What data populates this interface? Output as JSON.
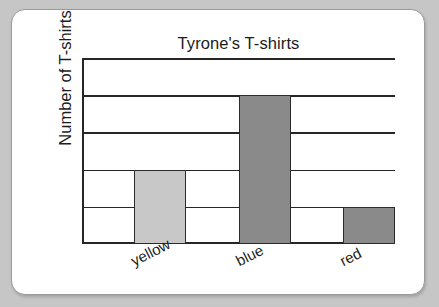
{
  "card": {
    "background_color": "#ffffff",
    "border_color": "#9b9b9b",
    "page_background_color": "#c6c6c6"
  },
  "chart_data": {
    "type": "bar",
    "title": "Tyrone's T-shirts",
    "xlabel": "",
    "ylabel": "Number of T-shirts",
    "categories": [
      "yellow",
      "blue",
      "red"
    ],
    "values": [
      2,
      4,
      1
    ],
    "ylim": [
      0,
      5
    ],
    "yticks": [
      0,
      1,
      2,
      3,
      4,
      5
    ],
    "ytick_labels": [
      "",
      "",
      "",
      "",
      "",
      ""
    ],
    "grid": true,
    "grid_orientation": "horizontal",
    "legend": "none",
    "bar_colors": [
      "#c8c8c8",
      "#8a8a8a",
      "#8a8a8a"
    ],
    "bar_edge_color": "#2b2b2b",
    "axis_color": "#262626",
    "x_tick_rotation": -27,
    "bars": [
      {
        "category": "yellow",
        "value": 2,
        "fill": "#c8c8c8"
      },
      {
        "category": "blue",
        "value": 4,
        "fill": "#8a8a8a"
      },
      {
        "category": "red",
        "value": 1,
        "fill": "#8a8a8a"
      }
    ]
  }
}
